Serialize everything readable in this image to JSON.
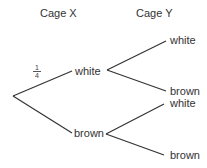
{
  "headers": {
    "stage1": "Cage X",
    "stage2": "Cage Y"
  },
  "stage1": {
    "branches": [
      {
        "label": "white",
        "probability": {
          "numerator": "1",
          "denominator": "4"
        }
      },
      {
        "label": "brown",
        "probability": null
      }
    ]
  },
  "stage2": {
    "from_white": [
      {
        "label": "white"
      },
      {
        "label": "brown"
      }
    ],
    "from_brown": [
      {
        "label": "white"
      },
      {
        "label": "brown"
      }
    ]
  },
  "colors": {
    "line": "#333333",
    "text": "#333333",
    "background": "#ffffff"
  }
}
